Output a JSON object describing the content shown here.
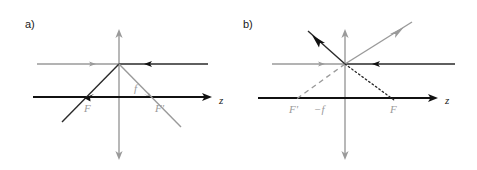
{
  "figure": {
    "background_color": "#ffffff",
    "width": 477,
    "height": 170,
    "colors": {
      "black": "#1a1a1a",
      "gray": "#9a9a9a",
      "axis_black": "#111111"
    }
  },
  "panels": [
    {
      "id": "panel-a",
      "label": "a)",
      "label_x": 25,
      "label_y": 28,
      "description": "Converging lens ray diagram with positive focal length",
      "axis": {
        "z_label": "z",
        "z_label_x": 219,
        "z_label_y": 104,
        "horizontal_y": 97,
        "horizontal_x_start": 33,
        "horizontal_x_end": 211,
        "vertical_x": 119,
        "vertical_y_top": 30,
        "vertical_y_bottom": 159
      },
      "center": {
        "x": 119,
        "y": 64
      },
      "focal_points": [
        {
          "name": "F",
          "label": "F",
          "label_x": 84,
          "label_y": 112,
          "point_x": 86,
          "point_y": 97
        },
        {
          "name": "F-prime",
          "label": "F'",
          "label_x": 155,
          "label_y": 112,
          "point_x": 157,
          "point_y": 97
        }
      ],
      "focal_length_label": {
        "label": "f",
        "label_x": 134,
        "label_y": 92
      },
      "rays": [
        {
          "name": "incoming-horizontal-gray",
          "style": "solid",
          "color": "gray",
          "arrow": "right",
          "arrow_x": 93,
          "arrow_y": 64
        },
        {
          "name": "incoming-horizontal-black",
          "style": "solid",
          "color": "black",
          "arrow": "left",
          "arrow_x": 150,
          "arrow_y": 64
        },
        {
          "name": "refracted-down-left-black",
          "style": "solid",
          "color": "black",
          "arrow": "down-left",
          "arrow_x": 88,
          "arrow_y": 95
        },
        {
          "name": "refracted-down-right-gray",
          "style": "solid",
          "color": "gray",
          "arrow": "down-right",
          "arrow_x": 152,
          "arrow_y": 97
        }
      ]
    },
    {
      "id": "panel-b",
      "label": "b)",
      "label_x": 243,
      "label_y": 28,
      "description": "Diverging lens ray diagram with negative focal length",
      "axis": {
        "z_label": "z",
        "z_label_x": 445,
        "z_label_y": 104,
        "horizontal_y": 98,
        "horizontal_x_start": 258,
        "horizontal_x_end": 437,
        "vertical_x": 345,
        "vertical_y_top": 30,
        "vertical_y_bottom": 159
      },
      "center": {
        "x": 345,
        "y": 64
      },
      "focal_points": [
        {
          "name": "F-prime",
          "label": "F'",
          "label_x": 289,
          "label_y": 113,
          "point_x": 297,
          "point_y": 98
        },
        {
          "name": "F",
          "label": "F",
          "label_x": 390,
          "label_y": 113,
          "point_x": 392,
          "point_y": 98
        }
      ],
      "focal_length_label": {
        "label": "−f",
        "label_x": 314,
        "label_y": 113
      },
      "rays": [
        {
          "name": "incoming-horizontal-gray",
          "style": "solid",
          "color": "gray",
          "arrow": "right",
          "arrow_x": 322,
          "arrow_y": 64
        },
        {
          "name": "incoming-horizontal-black",
          "style": "solid",
          "color": "black",
          "arrow": "left",
          "arrow_x": 378,
          "arrow_y": 64
        },
        {
          "name": "refracted-up-left-black",
          "style": "solid",
          "color": "black",
          "arrow": "up-left",
          "arrow_x": 320,
          "arrow_y": 42
        },
        {
          "name": "refracted-up-right-gray",
          "style": "solid",
          "color": "gray",
          "arrow": "up-right",
          "arrow_x": 395,
          "arrow_y": 40
        },
        {
          "name": "virtual-extension-down-left-dashed",
          "style": "dashed",
          "color": "gray",
          "arrow": "none"
        },
        {
          "name": "virtual-extension-down-right-dotted",
          "style": "dotted",
          "color": "black",
          "arrow": "none"
        }
      ]
    }
  ]
}
